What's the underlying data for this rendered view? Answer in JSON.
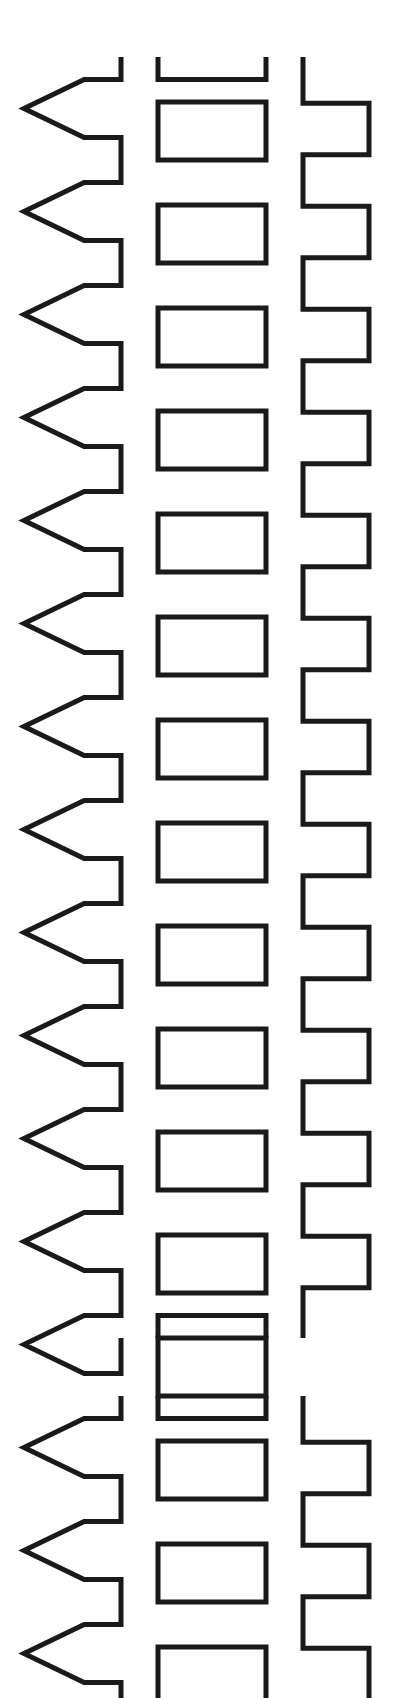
{
  "figure": {
    "kind": "technical-line-drawing",
    "style": "patent-figure",
    "canvas": {
      "width": 409,
      "height": 1698,
      "background_color": "#ffffff"
    },
    "ink": {
      "stroke_color": "#1a1a1a",
      "stroke_width": 5,
      "fill": "none"
    },
    "geometry": {
      "row_period": 103.0,
      "left_rail": {
        "name": "chevron-rail",
        "tip_x": 24,
        "spine_x": 121,
        "notch_half_height": 29,
        "arrow_count_block1": 13,
        "arrow_count_block2": 4
      },
      "center_rail": {
        "name": "rectangle-rail",
        "left_x": 158,
        "right_x": 266,
        "cell_height": 58,
        "cell_gap": 45,
        "cell_count_block1": 13,
        "cell_count_block2": 4
      },
      "right_rail": {
        "name": "square-wave-rail",
        "inner_x": 303,
        "outer_x": 369,
        "step_height": 51.5,
        "step_count_block1": 25,
        "step_count_block2": 7
      },
      "blocks": [
        {
          "name": "upper-block",
          "start_y": 57,
          "end_y": 1338,
          "rows": 13,
          "clipped_top": false,
          "clipped_bottom": false
        },
        {
          "name": "lower-block",
          "start_y": 1396,
          "end_y": 1698,
          "rows": 4,
          "clipped_top": false,
          "clipped_bottom": true
        }
      ],
      "block_gap": {
        "name": "inter-block-gap",
        "start_y": 1338,
        "end_y": 1396,
        "height": 58
      }
    }
  }
}
